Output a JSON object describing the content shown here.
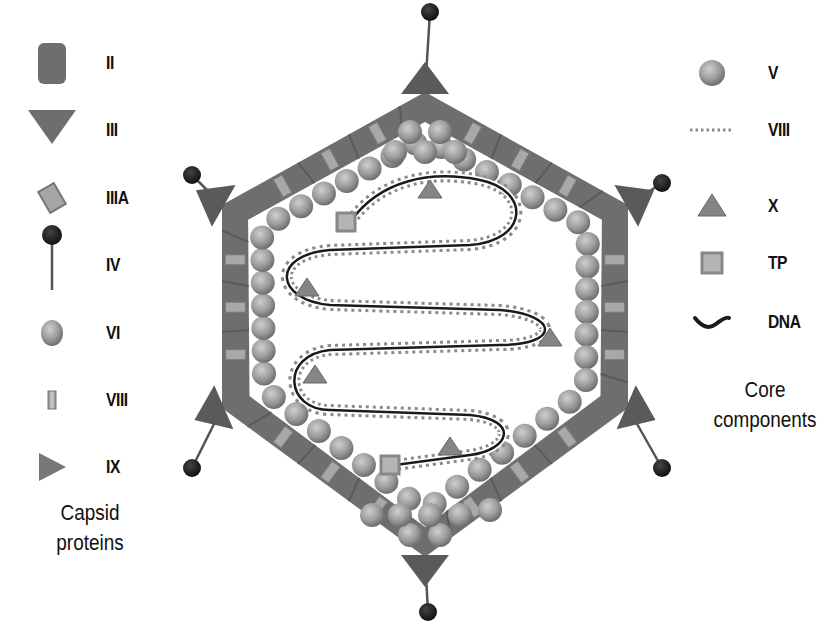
{
  "colors": {
    "capsid": "#6e6e6e",
    "capsid_dark": "#5a5a5a",
    "sphere": "#9a9a9a",
    "sphere_light": "#c9c9c9",
    "knob": "#1e1e1e",
    "dna": "#1a1a1a",
    "viii_dots": "#8a8a8a",
    "small_light": "#b5b5b5"
  },
  "legend_capsid": {
    "title_line1": "Capsid",
    "title_line2": "proteins",
    "items": [
      {
        "label": "II",
        "icon": "rounded-rect",
        "y": 63
      },
      {
        "label": "III",
        "icon": "down-triangle",
        "y": 130
      },
      {
        "label": "IIIA",
        "icon": "tilted-rect",
        "y": 198
      },
      {
        "label": "IV",
        "icon": "fiber-knob",
        "y": 265
      },
      {
        "label": "VI",
        "icon": "sphere",
        "y": 333
      },
      {
        "label": "VIII",
        "icon": "small-bar",
        "y": 400
      },
      {
        "label": "IX",
        "icon": "right-triangle",
        "y": 467
      }
    ]
  },
  "legend_core": {
    "title_line1": "Core",
    "title_line2": "components",
    "items": [
      {
        "label": "V",
        "icon": "sphere",
        "y": 73
      },
      {
        "label": "VIII",
        "icon": "dotted-line",
        "y": 130
      },
      {
        "label": "X",
        "icon": "up-triangle",
        "y": 206
      },
      {
        "label": "TP",
        "icon": "square",
        "y": 263
      },
      {
        "label": "DNA",
        "icon": "dna-curve",
        "y": 322
      }
    ]
  },
  "virion": {
    "vertices": [
      [
        425,
        92
      ],
      [
        628,
        205
      ],
      [
        628,
        408
      ],
      [
        425,
        557
      ],
      [
        222,
        408
      ],
      [
        222,
        205
      ]
    ],
    "fiber_knobs": [
      [
        430,
        12
      ],
      [
        662,
        183
      ],
      [
        662,
        468
      ],
      [
        428,
        612
      ],
      [
        192,
        468
      ],
      [
        192,
        175
      ]
    ],
    "x_triangles": [
      [
        430,
        190
      ],
      [
        307,
        288
      ],
      [
        550,
        338
      ],
      [
        315,
        375
      ],
      [
        450,
        447
      ]
    ],
    "tp_squares": [
      [
        346,
        222
      ],
      [
        390,
        465
      ]
    ]
  }
}
